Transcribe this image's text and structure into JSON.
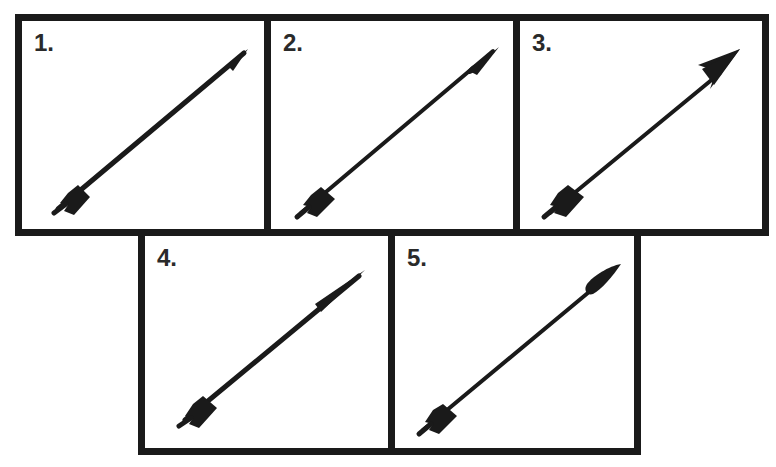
{
  "diagram": {
    "title": "",
    "stroke_color": "#1a1a1a",
    "panels": [
      {
        "label": "1.",
        "description": "arrow with thin needle point tip",
        "head": "needle"
      },
      {
        "label": "2.",
        "description": "arrow with small bodkin tip",
        "head": "small-bodkin"
      },
      {
        "label": "3.",
        "description": "arrow with broad barbed broadhead tip",
        "head": "broadhead"
      },
      {
        "label": "4.",
        "description": "arrow with tapered conical tip",
        "head": "tapered"
      },
      {
        "label": "5.",
        "description": "arrow with leaf-shaped tip",
        "head": "leaf"
      }
    ]
  }
}
